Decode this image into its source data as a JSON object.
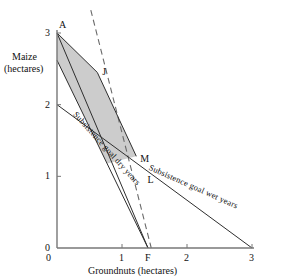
{
  "chart_data": {
    "type": "line",
    "title": "",
    "xlabel": "Groundnuts (hectares)",
    "ylabel_line1": "Maize",
    "ylabel_line2": "(hectares)",
    "xlim": [
      0,
      3
    ],
    "ylim": [
      0,
      3
    ],
    "xticks": [
      "0",
      "1",
      "2",
      "3"
    ],
    "xtick_values": [
      0,
      1,
      2,
      3
    ],
    "yticks": [
      "0",
      "1",
      "2",
      "3"
    ],
    "ytick_values": [
      0,
      1,
      2,
      3
    ],
    "grid": false,
    "legend": "none",
    "point_labels": [
      {
        "name": "A",
        "x": 0.0,
        "y": 3.0
      },
      {
        "name": "J",
        "x": 0.62,
        "y": 2.45
      },
      {
        "name": "M",
        "x": 1.22,
        "y": 1.28
      },
      {
        "name": "L",
        "x": 1.33,
        "y": 1.0
      },
      {
        "name": "F",
        "x": 1.4,
        "y": 0.0
      }
    ],
    "series": [
      {
        "name": "Subsistence goal dry years",
        "style": "solid",
        "annotation": "Subsistence goal dry years",
        "points": [
          [
            0.0,
            2.62
          ],
          [
            1.4,
            0.0
          ]
        ]
      },
      {
        "name": "Subsistence goal wet years",
        "style": "solid",
        "annotation": "Subsistence goal wet years",
        "points": [
          [
            0.0,
            2.0
          ],
          [
            3.0,
            0.0
          ]
        ]
      },
      {
        "name": "constraint-line-A-F",
        "style": "solid",
        "annotation": "",
        "points": [
          [
            0.0,
            3.0
          ],
          [
            1.4,
            0.0
          ]
        ]
      },
      {
        "name": "budget-line-dashed",
        "style": "dashed",
        "annotation": "",
        "points": [
          [
            0.52,
            3.32
          ],
          [
            1.45,
            0.0
          ]
        ]
      }
    ],
    "shaded_region": {
      "name": "feasible-region",
      "fill": "#c9c9c9",
      "vertices": [
        [
          0.0,
          3.0
        ],
        [
          0.62,
          2.45
        ],
        [
          1.22,
          1.28
        ],
        [
          0.77,
          1.18
        ],
        [
          0.0,
          2.62
        ]
      ]
    },
    "annotations": [
      {
        "text": "Subsistence goal dry years",
        "rotation": 48
      },
      {
        "text": "Subsistence goal wet years",
        "rotation": 24
      }
    ]
  },
  "axis": {
    "x_title": "Groundnuts (hectares)",
    "y_title_1": "Maize",
    "y_title_2": "(hectares)"
  },
  "labels": {
    "A": "A",
    "J": "J",
    "M": "M",
    "L": "L",
    "F": "F",
    "x0": "0",
    "x1": "1",
    "x2": "2",
    "x3": "3",
    "y0": "0",
    "y1": "1",
    "y2": "2",
    "y3": "3",
    "dry": "Subsistence goal dry years",
    "wet": "Subsistence goal wet years"
  },
  "colors": {
    "ink": "#1a1a1a",
    "axis": "#555555",
    "shade": "#c9c9c9",
    "line": "#3a3a3a"
  }
}
